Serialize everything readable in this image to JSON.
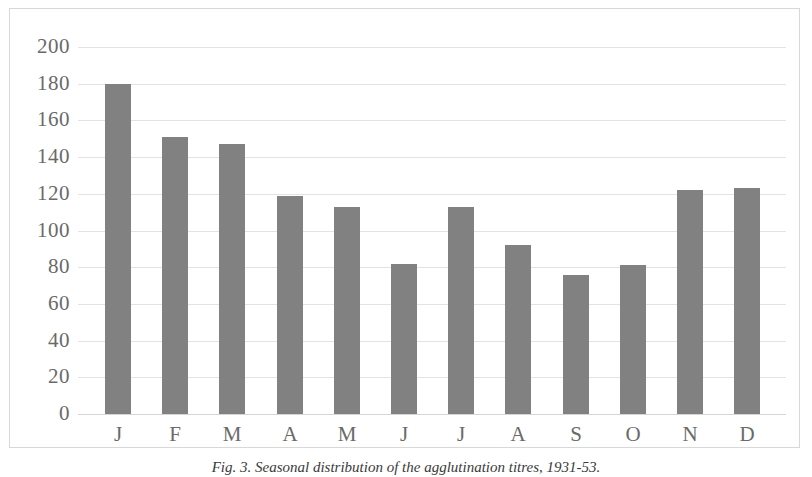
{
  "figure": {
    "caption": "Fig. 3. Seasonal distribution of the agglutination titres, 1931-53."
  },
  "colors": {
    "bar_fill": "#818181",
    "gridline": "#e3e3e3",
    "baseline": "#d5d5d5",
    "frame_border": "#d8d8d8",
    "tick_label": "#6a6a6a",
    "background": "#ffffff"
  },
  "chart_data": {
    "type": "bar",
    "title": "",
    "subtitle": "",
    "xlabel": "",
    "ylabel": "",
    "categories": [
      "J",
      "F",
      "M",
      "A",
      "M",
      "J",
      "J",
      "A",
      "S",
      "O",
      "N",
      "D"
    ],
    "category_names": [
      "January",
      "February",
      "March",
      "April",
      "May",
      "June",
      "July",
      "August",
      "September",
      "October",
      "November",
      "December"
    ],
    "values": [
      180,
      151,
      147,
      119,
      113,
      82,
      113,
      92,
      76,
      81,
      122,
      123
    ],
    "ylim": [
      0,
      200
    ],
    "ytick_step": 20,
    "yticks": [
      200,
      180,
      160,
      140,
      120,
      100,
      80,
      60,
      40,
      20,
      0
    ],
    "ytick_labels": [
      "200",
      "180",
      "160",
      "140",
      "120",
      "100",
      "80",
      "60",
      "40",
      "20",
      "0"
    ],
    "grid": true,
    "grid_axis": "y",
    "legend": false,
    "legend_position": "none",
    "series": [
      {
        "name": "",
        "values": [
          180,
          151,
          147,
          119,
          113,
          82,
          113,
          92,
          76,
          81,
          122,
          123
        ]
      }
    ]
  }
}
